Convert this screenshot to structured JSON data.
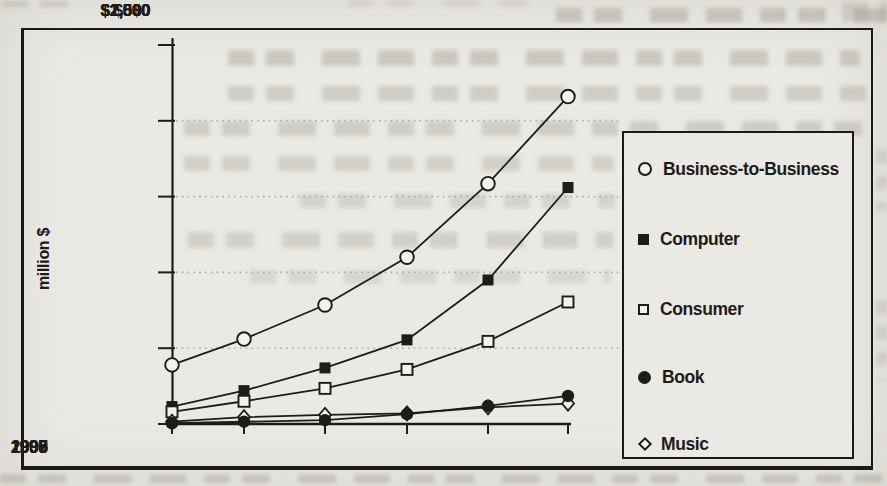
{
  "chart_data": {
    "type": "line",
    "title": "",
    "ylabel": "million $",
    "xlabel": "",
    "x": [
      "1995",
      "1996",
      "1997",
      "1998",
      "1999",
      "2000"
    ],
    "yticks": [
      "$2,500",
      "$2,000",
      "$1,500",
      "$1,000",
      "$500",
      "$0"
    ],
    "ylim": [
      0,
      2500
    ],
    "grid": "dotted horizontal gridlines at 500, 1000, 1500, 2000",
    "legend_position": "boxed legend at right",
    "series": [
      {
        "name": "Business-to-Business",
        "marker": "open-circle",
        "values": [
          390,
          560,
          785,
          1100,
          1585,
          2160
        ]
      },
      {
        "name": "Computer",
        "marker": "filled-square",
        "values": [
          115,
          220,
          370,
          555,
          950,
          1560
        ]
      },
      {
        "name": "Consumer",
        "marker": "open-square",
        "values": [
          80,
          150,
          235,
          360,
          545,
          805
        ]
      },
      {
        "name": "Book",
        "marker": "filled-circle",
        "values": [
          5,
          15,
          25,
          65,
          120,
          185
        ]
      },
      {
        "name": "Music",
        "marker": "open-diamond",
        "values": [
          15,
          45,
          60,
          70,
          110,
          135
        ]
      }
    ],
    "colors": {
      "ink": "#1d1c1a",
      "paper": "#ebe9e4",
      "gridline": "#aeaba2",
      "marker_fill": "#f4f2ee"
    }
  }
}
